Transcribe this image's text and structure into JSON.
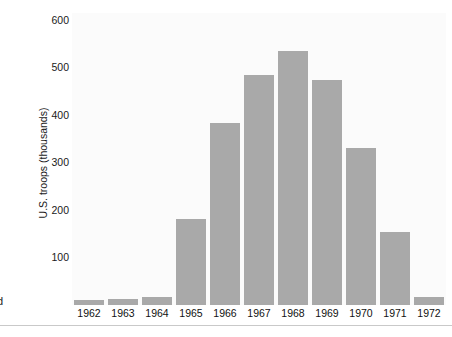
{
  "chart_data": {
    "type": "bar",
    "title": "",
    "subtitle": "",
    "xlabel": "",
    "ylabel": "U.S. troops (thousands)",
    "categories": [
      "1962",
      "1963",
      "1964",
      "1965",
      "1966",
      "1967",
      "1968",
      "1969",
      "1970",
      "1971",
      "1972"
    ],
    "values": [
      10,
      13,
      17,
      182,
      384,
      485,
      535,
      474,
      330,
      153,
      16
    ],
    "series": [
      {
        "name": "U.S. troops (thousands)",
        "values": [
          10,
          13,
          17,
          182,
          384,
          485,
          535,
          474,
          330,
          153,
          16
        ]
      }
    ],
    "ylim": [
      0,
      620
    ],
    "yticks": [
      100,
      200,
      300,
      400,
      500,
      600
    ],
    "ytick_labels": [
      "100",
      "200",
      "300",
      "400",
      "500",
      "600"
    ],
    "grid": false,
    "legend": null,
    "legend_position": "none",
    "bar_color": "#a9a9a9",
    "plot_background": "#fbfbfb",
    "annotations": {
      "clipped_left_glyph": "d"
    }
  }
}
